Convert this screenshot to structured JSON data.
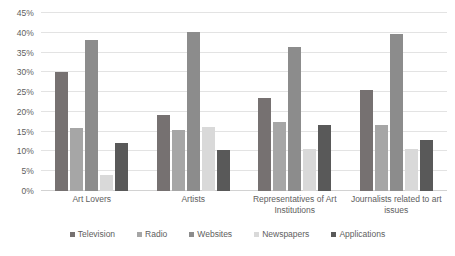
{
  "chart_data": {
    "type": "bar",
    "title": "",
    "subtitle": "",
    "xlabel": "",
    "ylabel": "",
    "ylim": [
      0,
      45
    ],
    "grid": true,
    "legend_position": "bottom",
    "orientation": "vertical",
    "grouping": "grouped",
    "value_suffix": "%",
    "categories": [
      "Art Lovers",
      "Artists",
      "Representatives of Art Institutions",
      "Journalists related to art issues"
    ],
    "ticks": [
      "0%",
      "5%",
      "10%",
      "15%",
      "20%",
      "25%",
      "30%",
      "35%",
      "40%",
      "45%"
    ],
    "tick_values": [
      0,
      5,
      10,
      15,
      20,
      25,
      30,
      35,
      40,
      45
    ],
    "series": [
      {
        "name": "Television",
        "color": "#767171",
        "values": [
          30.0,
          19.3,
          23.4,
          25.6
        ]
      },
      {
        "name": "Radio",
        "color": "#a6a6a6",
        "values": [
          16.0,
          15.3,
          17.5,
          16.7
        ]
      },
      {
        "name": "Websites",
        "color": "#8c8c8c",
        "values": [
          38.2,
          40.3,
          36.5,
          39.8
        ]
      },
      {
        "name": "Newspapers",
        "color": "#d9d9d9",
        "values": [
          4.1,
          16.3,
          10.6,
          10.7
        ]
      },
      {
        "name": "Applications",
        "color": "#595959",
        "values": [
          12.1,
          10.4,
          16.6,
          12.8
        ]
      }
    ]
  },
  "colors": {
    "gridline": "#e3e3e3",
    "baseline": "#d2d2d2",
    "text": "#606060",
    "background": "#ffffff"
  }
}
